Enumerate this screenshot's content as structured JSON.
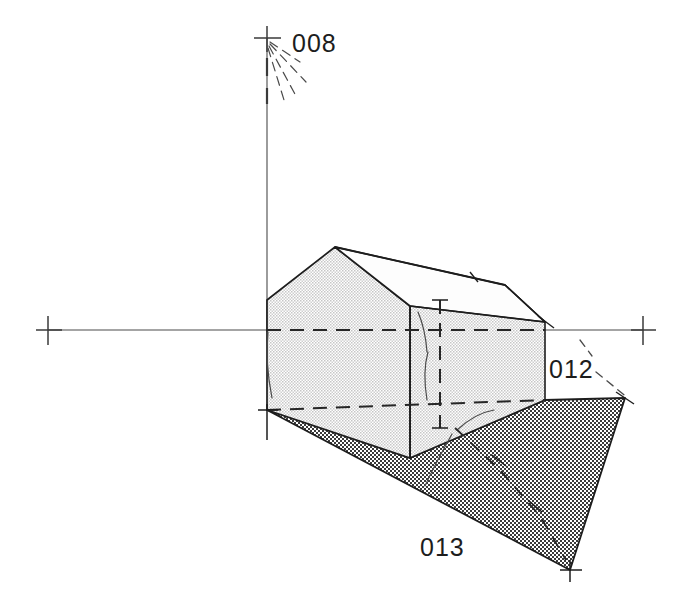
{
  "drawing": {
    "kind": "architectural-axonometric-sketch",
    "subject": "gabled house volume on hatched site plane",
    "background_color": "#ffffff",
    "ink_color": "#1d1d1d",
    "wall_fill_color": "#d9d9d9",
    "roof_fill_color": "#fdfdfd",
    "ground_fill_color": "#8c8c8c"
  },
  "labels": {
    "vertical_axis_label": "008",
    "right_edge_label": "012",
    "ground_plane_label": "013"
  },
  "axes": {
    "vertical": {
      "top_marker": "cross",
      "x": 267,
      "y_top": 38,
      "y_bottom": 330
    },
    "horizontal": {
      "y": 330,
      "x_left_marker": 48,
      "x_right_marker": 643,
      "left_marker": "cross",
      "right_marker": "cross"
    }
  },
  "geometry": {
    "house_gable_front": [
      [
        267,
        300
      ],
      [
        335,
        247
      ],
      [
        410,
        306
      ],
      [
        410,
        458
      ],
      [
        267,
        410
      ]
    ],
    "house_side_wall": [
      [
        410,
        306
      ],
      [
        505,
        285
      ],
      [
        545,
        322
      ],
      [
        545,
        400
      ],
      [
        410,
        458
      ]
    ],
    "roof_plane": [
      [
        335,
        247
      ],
      [
        505,
        285
      ],
      [
        545,
        322
      ],
      [
        410,
        306
      ]
    ],
    "ground_plane": [
      [
        267,
        410
      ],
      [
        410,
        458
      ],
      [
        545,
        400
      ],
      [
        625,
        398
      ],
      [
        570,
        570
      ]
    ],
    "hidden_lines": [
      [
        [
          267,
          330
        ],
        [
          545,
          330
        ]
      ],
      [
        [
          267,
          410
        ],
        [
          545,
          400
        ]
      ],
      [
        [
          440,
          300
        ],
        [
          440,
          428
        ]
      ]
    ]
  },
  "leader_rays": {
    "count": 4,
    "origin": [
      267,
      38
    ],
    "label_anchor": "008"
  }
}
